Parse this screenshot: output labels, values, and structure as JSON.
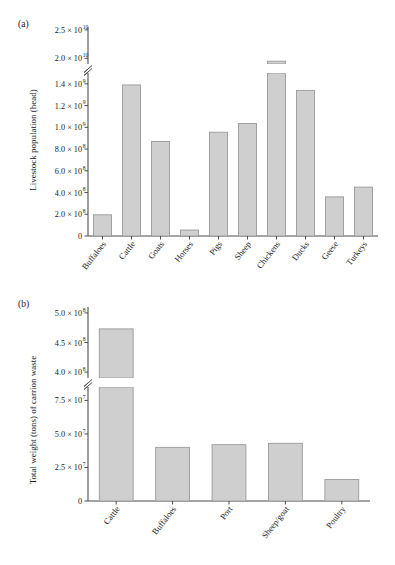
{
  "figure": {
    "background": "#ffffff",
    "bar_fill": "#cfcfcf",
    "bar_stroke": "#9a9a9a",
    "axis_color": "#4d4d4d"
  },
  "panels": [
    {
      "tag": "(a)",
      "ylabel": "Livestock population (head)"
    },
    {
      "tag": "(b)",
      "ylabel": "Total weight (tons) of carrion waste"
    }
  ],
  "chart_data": [
    {
      "type": "bar",
      "panel": "(a)",
      "title": "",
      "xlabel": "",
      "ylabel": "Livestock population (head)",
      "categories": [
        "Buffaloes",
        "Cattle",
        "Goats",
        "Horses",
        "Pigs",
        "Sheep",
        "Chickens",
        "Ducks",
        "Geese",
        "Turkeys"
      ],
      "values": [
        195000000,
        1390000000,
        870000000,
        55000000,
        955000000,
        1035000000,
        19500000000,
        1340000000,
        360000000,
        450000000
      ],
      "broken_axis": true,
      "lower_segment": {
        "ylim": [
          0,
          1500000000
        ],
        "ticks": [
          0,
          200000000,
          400000000,
          600000000,
          800000000,
          1000000000,
          1200000000,
          1400000000
        ],
        "tick_labels": [
          "0",
          "2.0 × 10",
          "4.0 × 10",
          "6.0 × 10",
          "8.0 × 10",
          "1.0 × 10",
          "1.2 × 10",
          "1.4 × 10"
        ],
        "tick_exponents": [
          "",
          "8",
          "8",
          "8",
          "8",
          "9",
          "9",
          "9"
        ]
      },
      "upper_segment": {
        "ylim": [
          19000000000,
          25500000000
        ],
        "ticks": [
          20000000000,
          25000000000
        ],
        "tick_labels": [
          "2.0 × 10",
          "2.5 × 10"
        ],
        "tick_exponents": [
          "10",
          "10"
        ]
      },
      "grid": false,
      "legend": "none"
    },
    {
      "type": "bar",
      "panel": "(b)",
      "title": "",
      "xlabel": "",
      "ylabel": "Total weight (tons) of carrion waste",
      "categories": [
        "Cattle",
        "Buffaloes",
        "Port",
        "Sheep/goat",
        "Poultry"
      ],
      "values": [
        473000000,
        40000000,
        42000000,
        43000000,
        16000000
      ],
      "broken_axis": true,
      "lower_segment": {
        "ylim": [
          0,
          85000000
        ],
        "ticks": [
          0,
          25000000,
          50000000,
          75000000
        ],
        "tick_labels": [
          "0",
          "2.5 × 10",
          "5.0 × 10",
          "7.5 × 10"
        ],
        "tick_exponents": [
          "",
          "7",
          "7",
          "7"
        ]
      },
      "upper_segment": {
        "ylim": [
          390000000,
          510000000
        ],
        "ticks": [
          400000000,
          450000000,
          500000000
        ],
        "tick_labels": [
          "4.0 × 10",
          "4.5 × 10",
          "5.0 × 10"
        ],
        "tick_exponents": [
          "8",
          "8",
          "8"
        ]
      },
      "grid": false,
      "legend": "none"
    }
  ]
}
